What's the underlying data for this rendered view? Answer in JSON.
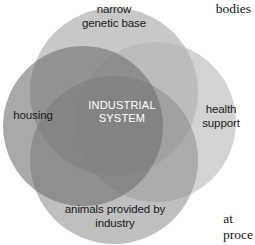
{
  "diagram": {
    "type": "venn-4-circle",
    "background_color": "#ffffff",
    "center_label": "INDUSTRIAL\nSYSTEM",
    "center_label_color": "#ffffff",
    "circles": [
      {
        "name": "narrow-genetic-base",
        "label": "narrow\ngenetic base",
        "color": "#9a9a9a",
        "opacity": 0.55,
        "cx": 114,
        "cy": 92,
        "r": 84
      },
      {
        "name": "housing",
        "label": "housing",
        "color": "#6f6f6f",
        "opacity": 0.6,
        "cx": 83,
        "cy": 126,
        "r": 80
      },
      {
        "name": "health-support",
        "label": "health\nsupport",
        "color": "#b4b4b4",
        "opacity": 0.55,
        "cx": 156,
        "cy": 122,
        "r": 80
      },
      {
        "name": "animals-provided-by-industry",
        "label": "animals provided by\nindustry",
        "color": "#8b8b8b",
        "opacity": 0.55,
        "cx": 114,
        "cy": 160,
        "r": 84
      }
    ]
  },
  "page_text": {
    "top_right": "bodies",
    "bottom_right_line1": "at",
    "bottom_right_line2": "proce"
  }
}
